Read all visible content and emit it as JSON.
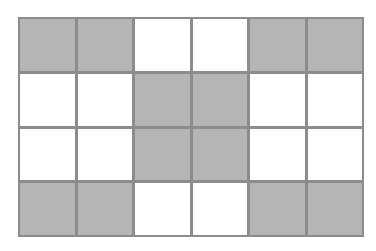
{
  "diagram": {
    "type": "grid-pattern",
    "rows": 4,
    "columns": 6,
    "colors": {
      "filled": "#b5b5b5",
      "empty": "#ffffff",
      "border": "#8c8c8c"
    },
    "cells": [
      [
        1,
        1,
        0,
        0,
        1,
        1
      ],
      [
        0,
        0,
        1,
        1,
        0,
        0
      ],
      [
        0,
        0,
        1,
        1,
        0,
        0
      ],
      [
        1,
        1,
        0,
        0,
        1,
        1
      ]
    ],
    "shaded_count": 12,
    "total_cells": 24
  }
}
